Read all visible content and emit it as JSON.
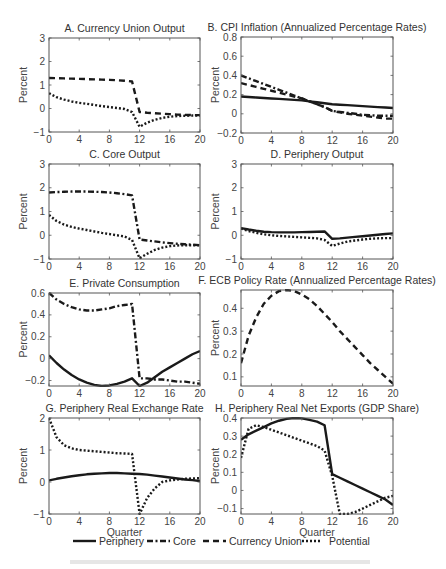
{
  "figure": {
    "legend": [
      {
        "key": "periphery",
        "label": "Periphery",
        "style": "solid"
      },
      {
        "key": "core",
        "label": "Core",
        "style": "dashdot"
      },
      {
        "key": "union",
        "label": "Currency Union",
        "style": "dashed"
      },
      {
        "key": "potential",
        "label": "Potential",
        "style": "dotted"
      }
    ],
    "line_color": "#1a1a1a",
    "axis_color": "#555555"
  },
  "chart_data": [
    {
      "type": "line",
      "title": "A. Currency Union Output",
      "xlabel": "",
      "ylabel": "Percent",
      "xlim": [
        0,
        20
      ],
      "ylim": [
        -1,
        3
      ],
      "xticks": [
        0,
        4,
        8,
        12,
        16,
        20
      ],
      "yticks": [
        -1,
        0,
        1,
        2,
        3
      ],
      "x": [
        0,
        1,
        2,
        3,
        4,
        5,
        6,
        7,
        8,
        9,
        10,
        11,
        12,
        13,
        14,
        15,
        16,
        17,
        18,
        19,
        20
      ],
      "series": [
        {
          "name": "Currency Union",
          "style": "dashed",
          "values": [
            1.3,
            1.29,
            1.28,
            1.27,
            1.26,
            1.25,
            1.24,
            1.23,
            1.22,
            1.2,
            1.18,
            1.15,
            -0.15,
            -0.18,
            -0.2,
            -0.22,
            -0.24,
            -0.26,
            -0.27,
            -0.28,
            -0.28
          ]
        },
        {
          "name": "Potential",
          "style": "dotted",
          "values": [
            0.65,
            0.48,
            0.38,
            0.3,
            0.24,
            0.2,
            0.15,
            0.1,
            0.06,
            0.02,
            -0.02,
            -0.15,
            -0.78,
            -0.6,
            -0.48,
            -0.4,
            -0.35,
            -0.32,
            -0.31,
            -0.3,
            -0.3
          ]
        }
      ]
    },
    {
      "type": "line",
      "title": "B. CPI Inflation (Annualized Percentage Rates)",
      "xlabel": "",
      "ylabel": "Percent",
      "xlim": [
        0,
        20
      ],
      "ylim": [
        -0.2,
        0.8
      ],
      "xticks": [
        0,
        4,
        8,
        12,
        16,
        20
      ],
      "yticks": [
        -0.2,
        0,
        0.2,
        0.4,
        0.6,
        0.8
      ],
      "x": [
        0,
        1,
        2,
        3,
        4,
        5,
        6,
        7,
        8,
        9,
        10,
        11,
        12,
        13,
        14,
        15,
        16,
        17,
        18,
        19,
        20
      ],
      "series": [
        {
          "name": "Periphery",
          "style": "solid",
          "values": [
            0.18,
            0.175,
            0.17,
            0.165,
            0.16,
            0.155,
            0.15,
            0.145,
            0.14,
            0.13,
            0.12,
            0.11,
            0.1,
            0.095,
            0.09,
            0.085,
            0.08,
            0.075,
            0.07,
            0.065,
            0.06
          ]
        },
        {
          "name": "Core",
          "style": "dashdot",
          "values": [
            0.4,
            0.37,
            0.34,
            0.31,
            0.28,
            0.25,
            0.22,
            0.19,
            0.16,
            0.13,
            0.1,
            0.07,
            0.03,
            0.02,
            0.01,
            0.0,
            -0.01,
            -0.015,
            -0.02,
            -0.02,
            -0.02
          ]
        },
        {
          "name": "Currency Union",
          "style": "dashed",
          "values": [
            0.32,
            0.3,
            0.28,
            0.26,
            0.24,
            0.22,
            0.2,
            0.18,
            0.16,
            0.13,
            0.1,
            0.07,
            0.03,
            0.015,
            0.0,
            -0.01,
            -0.02,
            -0.03,
            -0.04,
            -0.05,
            -0.05
          ]
        }
      ]
    },
    {
      "type": "line",
      "title": "C. Core Output",
      "xlabel": "",
      "ylabel": "Percent",
      "xlim": [
        0,
        20
      ],
      "ylim": [
        -1,
        3
      ],
      "xticks": [
        0,
        4,
        8,
        12,
        16,
        20
      ],
      "yticks": [
        -1,
        0,
        1,
        2,
        3
      ],
      "x": [
        0,
        1,
        2,
        3,
        4,
        5,
        6,
        7,
        8,
        9,
        10,
        11,
        12,
        13,
        14,
        15,
        16,
        17,
        18,
        19,
        20
      ],
      "series": [
        {
          "name": "Core",
          "style": "dashdot",
          "values": [
            1.8,
            1.82,
            1.83,
            1.84,
            1.84,
            1.84,
            1.83,
            1.82,
            1.8,
            1.77,
            1.73,
            1.68,
            -0.18,
            -0.22,
            -0.26,
            -0.3,
            -0.33,
            -0.36,
            -0.38,
            -0.4,
            -0.42
          ]
        },
        {
          "name": "Potential",
          "style": "dotted",
          "values": [
            0.85,
            0.6,
            0.45,
            0.35,
            0.28,
            0.22,
            0.16,
            0.1,
            0.05,
            0.0,
            -0.05,
            -0.2,
            -0.97,
            -0.78,
            -0.62,
            -0.52,
            -0.46,
            -0.43,
            -0.42,
            -0.42,
            -0.42
          ]
        }
      ]
    },
    {
      "type": "line",
      "title": "D. Periphery Output",
      "xlabel": "",
      "ylabel": "Percent",
      "xlim": [
        0,
        20
      ],
      "ylim": [
        -1,
        3
      ],
      "xticks": [
        0,
        4,
        8,
        12,
        16,
        20
      ],
      "yticks": [
        -1,
        0,
        1,
        2,
        3
      ],
      "x": [
        0,
        1,
        2,
        3,
        4,
        5,
        6,
        7,
        8,
        9,
        10,
        11,
        12,
        13,
        14,
        15,
        16,
        17,
        18,
        19,
        20
      ],
      "series": [
        {
          "name": "Periphery",
          "style": "solid",
          "values": [
            0.3,
            0.24,
            0.19,
            0.15,
            0.13,
            0.12,
            0.12,
            0.12,
            0.13,
            0.14,
            0.15,
            0.16,
            -0.15,
            -0.13,
            -0.1,
            -0.07,
            -0.04,
            -0.01,
            0.02,
            0.05,
            0.08
          ]
        },
        {
          "name": "Potential",
          "style": "dotted",
          "values": [
            0.28,
            0.18,
            0.1,
            0.04,
            0.0,
            -0.03,
            -0.05,
            -0.07,
            -0.09,
            -0.11,
            -0.13,
            -0.2,
            -0.45,
            -0.35,
            -0.27,
            -0.22,
            -0.18,
            -0.15,
            -0.13,
            -0.12,
            -0.12
          ]
        }
      ]
    },
    {
      "type": "line",
      "title": "E. Private Consumption",
      "xlabel": "",
      "ylabel": "Percent",
      "xlim": [
        0,
        20
      ],
      "ylim": [
        -0.25,
        0.6
      ],
      "xticks": [
        0,
        4,
        8,
        12,
        16,
        20
      ],
      "yticks": [
        -0.2,
        0,
        0.2,
        0.4,
        0.6
      ],
      "x": [
        0,
        1,
        2,
        3,
        4,
        5,
        6,
        7,
        8,
        9,
        10,
        11,
        12,
        13,
        14,
        15,
        16,
        17,
        18,
        19,
        20
      ],
      "series": [
        {
          "name": "Periphery",
          "style": "solid",
          "values": [
            0.03,
            -0.04,
            -0.1,
            -0.15,
            -0.19,
            -0.22,
            -0.24,
            -0.25,
            -0.245,
            -0.23,
            -0.21,
            -0.18,
            -0.25,
            -0.22,
            -0.17,
            -0.12,
            -0.08,
            -0.04,
            0.0,
            0.04,
            0.07
          ]
        },
        {
          "name": "Core",
          "style": "dashdot",
          "values": [
            0.6,
            0.54,
            0.5,
            0.47,
            0.45,
            0.44,
            0.44,
            0.45,
            0.46,
            0.48,
            0.49,
            0.5,
            -0.18,
            -0.18,
            -0.19,
            -0.19,
            -0.2,
            -0.21,
            -0.21,
            -0.22,
            -0.23
          ]
        }
      ]
    },
    {
      "type": "line",
      "title": "F. ECB Policy Rate (Annualized Percentage Rates)",
      "xlabel": "",
      "ylabel": "Percent",
      "xlim": [
        0,
        20
      ],
      "ylim": [
        0.06,
        0.48
      ],
      "xticks": [
        0,
        4,
        8,
        12,
        16,
        20
      ],
      "yticks": [
        0.1,
        0.2,
        0.3,
        0.4
      ],
      "x": [
        0,
        1,
        2,
        3,
        4,
        5,
        6,
        7,
        8,
        9,
        10,
        11,
        12,
        13,
        14,
        15,
        16,
        17,
        18,
        19,
        20
      ],
      "series": [
        {
          "name": "Currency Union",
          "style": "dashed",
          "values": [
            0.16,
            0.28,
            0.36,
            0.42,
            0.455,
            0.475,
            0.48,
            0.475,
            0.46,
            0.44,
            0.41,
            0.375,
            0.34,
            0.3,
            0.265,
            0.23,
            0.195,
            0.16,
            0.13,
            0.1,
            0.07
          ]
        }
      ]
    },
    {
      "type": "line",
      "title": "G. Periphery Real Exchange Rate",
      "xlabel": "Quarter",
      "ylabel": "Percent",
      "xlim": [
        0,
        20
      ],
      "ylim": [
        -1,
        2
      ],
      "xticks": [
        0,
        4,
        8,
        12,
        16,
        20
      ],
      "yticks": [
        -1,
        0,
        1,
        2
      ],
      "x": [
        0,
        1,
        2,
        3,
        4,
        5,
        6,
        7,
        8,
        9,
        10,
        11,
        12,
        13,
        14,
        15,
        16,
        17,
        18,
        19,
        20
      ],
      "series": [
        {
          "name": "Periphery",
          "style": "solid",
          "values": [
            0.05,
            0.1,
            0.14,
            0.18,
            0.21,
            0.24,
            0.26,
            0.27,
            0.28,
            0.28,
            0.27,
            0.26,
            0.25,
            0.23,
            0.2,
            0.17,
            0.14,
            0.11,
            0.08,
            0.06,
            0.03
          ]
        },
        {
          "name": "Potential",
          "style": "dotted",
          "values": [
            2.0,
            1.4,
            1.15,
            1.05,
            1.0,
            0.98,
            0.96,
            0.94,
            0.92,
            0.9,
            0.89,
            0.88,
            -1.0,
            -0.5,
            -0.2,
            0.0,
            0.05,
            0.08,
            0.1,
            0.11,
            0.12
          ]
        }
      ]
    },
    {
      "type": "line",
      "title": "H. Periphery Real Net Exports (GDP Share)",
      "xlabel": "Quarter",
      "ylabel": "Percent",
      "xlim": [
        0,
        20
      ],
      "ylim": [
        -0.13,
        0.4
      ],
      "xticks": [
        0,
        4,
        8,
        12,
        16,
        20
      ],
      "yticks": [
        -0.1,
        0,
        0.1,
        0.2,
        0.3,
        0.4
      ],
      "x": [
        0,
        1,
        2,
        3,
        4,
        5,
        6,
        7,
        8,
        9,
        10,
        11,
        12,
        13,
        14,
        15,
        16,
        17,
        18,
        19,
        20
      ],
      "series": [
        {
          "name": "Periphery",
          "style": "solid",
          "values": [
            0.28,
            0.31,
            0.33,
            0.35,
            0.37,
            0.385,
            0.395,
            0.4,
            0.398,
            0.39,
            0.38,
            0.36,
            0.09,
            0.07,
            0.05,
            0.03,
            0.01,
            -0.01,
            -0.03,
            -0.05,
            -0.08
          ]
        },
        {
          "name": "Potential",
          "style": "dotted",
          "values": [
            0.18,
            0.34,
            0.36,
            0.35,
            0.335,
            0.32,
            0.305,
            0.29,
            0.275,
            0.26,
            0.245,
            0.22,
            0.08,
            -0.13,
            -0.13,
            -0.12,
            -0.1,
            -0.08,
            -0.06,
            -0.04,
            -0.03
          ]
        }
      ]
    }
  ]
}
